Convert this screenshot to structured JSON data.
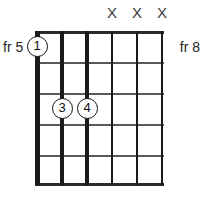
{
  "diagram": {
    "type": "guitar-chord-diagram",
    "string_count": 6,
    "fret_count": 5,
    "fret_label_left": "fr 5",
    "fret_label_right": "fr 8",
    "muted_symbol": "X",
    "grid_color": "#5a5a5a",
    "string_color": "#1a1a1a",
    "marker_color": "#111111",
    "strings": [
      {
        "index": 1,
        "x": 0,
        "width": 5,
        "muted": false
      },
      {
        "index": 2,
        "x": 25,
        "width": 4,
        "muted": false
      },
      {
        "index": 3,
        "x": 50,
        "width": 3.2,
        "muted": false
      },
      {
        "index": 4,
        "x": 75,
        "width": 2.4,
        "muted": true
      },
      {
        "index": 5,
        "x": 100,
        "width": 1.6,
        "muted": true
      },
      {
        "index": 6,
        "x": 125,
        "width": 1.2,
        "muted": true
      }
    ],
    "frets": [
      {
        "index": 0,
        "y": 0,
        "height": 3.4,
        "kind": "nut"
      },
      {
        "index": 1,
        "y": 31,
        "height": 1.6,
        "kind": "fret"
      },
      {
        "index": 2,
        "y": 62,
        "height": 1.6,
        "kind": "fret"
      },
      {
        "index": 3,
        "y": 93,
        "height": 1.6,
        "kind": "fret"
      },
      {
        "index": 4,
        "y": 124,
        "height": 1.6,
        "kind": "fret"
      },
      {
        "index": 5,
        "y": 152,
        "height": 3.4,
        "kind": "last"
      }
    ],
    "muted_marks": [
      {
        "label": "X",
        "x": 112
      },
      {
        "label": "X",
        "x": 137
      },
      {
        "label": "X",
        "x": 162
      }
    ],
    "fingers": [
      {
        "label": "1",
        "string": 1,
        "fret": 1,
        "x": 0,
        "y": 15
      },
      {
        "label": "3",
        "string": 2,
        "fret": 3,
        "x": 25,
        "y": 77
      },
      {
        "label": "4",
        "string": 3,
        "fret": 3,
        "x": 50,
        "y": 77
      }
    ]
  }
}
